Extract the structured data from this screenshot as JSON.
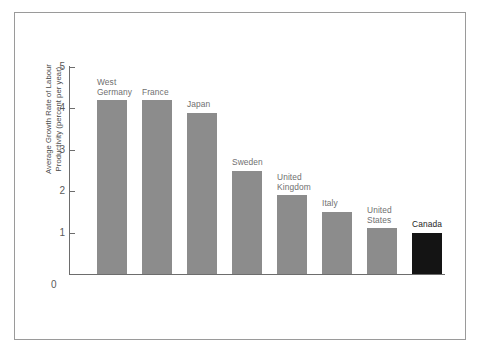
{
  "chart_data": {
    "type": "bar",
    "title": "",
    "subtitle": "",
    "xlabel": "",
    "ylabel": "Average Growth Rate of Labour\nProductivity (percent per year)",
    "ylim": [
      0,
      5
    ],
    "yticks": [
      0,
      1,
      2,
      3,
      4,
      5
    ],
    "ytick_labels": [
      "0",
      "1",
      "2",
      "3",
      "4",
      "5"
    ],
    "grid": false,
    "legend": "none",
    "categories": [
      "West\nGermany",
      "France",
      "Japan",
      "Sweden",
      "United\nKingdom",
      "Italy",
      "United\nStates",
      "Canada"
    ],
    "values": [
      4.2,
      4.2,
      3.9,
      2.5,
      1.9,
      1.5,
      1.1,
      1.0
    ],
    "bar_colors": [
      "#8c8c8c",
      "#8c8c8c",
      "#8c8c8c",
      "#8c8c8c",
      "#8c8c8c",
      "#8c8c8c",
      "#8c8c8c",
      "#141414"
    ],
    "highlight_category": "Canada",
    "axis_color": "#6d6d6d",
    "label_color": "#6f6f6f",
    "highlight_label_color": "#1d1d1d",
    "frame_color": "#9a9a9a",
    "background": "#ffffff"
  }
}
